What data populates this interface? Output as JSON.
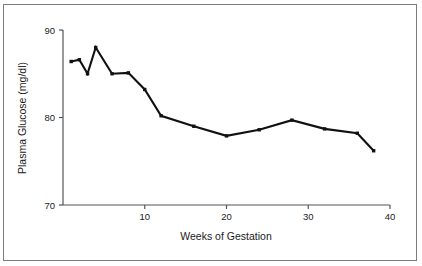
{
  "chart_data": {
    "type": "line",
    "title": "",
    "xlabel": "Weeks of Gestation",
    "ylabel": "Plasma Glucose (mg/dl)",
    "xlim": [
      0,
      40
    ],
    "ylim": [
      70,
      90
    ],
    "xticks": [
      10,
      20,
      30,
      40
    ],
    "xtick_labels": [
      "10",
      "20",
      "30",
      "40"
    ],
    "yticks": [
      70,
      80,
      90
    ],
    "ytick_labels": [
      "70",
      "80",
      "90"
    ],
    "grid": false,
    "legend": null,
    "line_color": "#111111",
    "marker": "square",
    "x": [
      1,
      2,
      3,
      4,
      6,
      8,
      10,
      12,
      16,
      20,
      24,
      28,
      32,
      36,
      38
    ],
    "values": [
      86.4,
      86.6,
      85.0,
      88.0,
      85.0,
      85.1,
      83.2,
      80.2,
      79.0,
      77.9,
      78.6,
      79.7,
      78.7,
      78.2,
      76.2
    ],
    "series": [
      {
        "name": "Plasma Glucose",
        "values": [
          86.4,
          86.6,
          85.0,
          88.0,
          85.0,
          85.1,
          83.2,
          80.2,
          79.0,
          77.9,
          78.6,
          79.7,
          78.7,
          78.2,
          76.2
        ]
      }
    ]
  },
  "figure": {
    "border_color": "#7c7c7c",
    "background": "#ffffff",
    "axis_color": "#555555"
  }
}
